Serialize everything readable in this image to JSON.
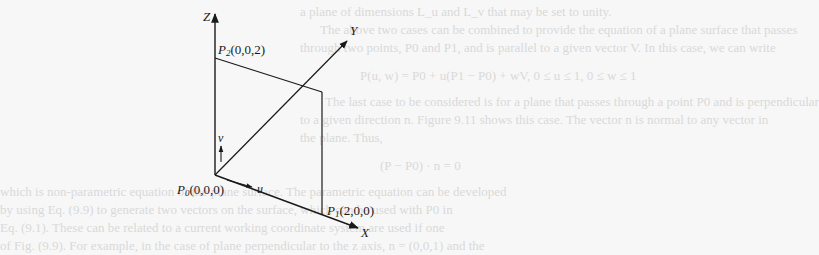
{
  "figure": {
    "axes": {
      "z_label": "Z",
      "y_label": "Y",
      "x_label": "X"
    },
    "points": [
      {
        "name": "P",
        "sub": "0",
        "coords": "(0,0,0)"
      },
      {
        "name": "P",
        "sub": "1",
        "coords": "(2,0,0)"
      },
      {
        "name": "P",
        "sub": "2",
        "coords": "(0,0,2)"
      }
    ],
    "vectors": {
      "u_label": "u",
      "v_label": "v"
    },
    "colors": {
      "line": "#1a1a1a",
      "background": "#f7f7f7",
      "bleed_text": "#d9d9d9"
    }
  },
  "bleed_through_text": [
    "a plane of dimensions L_u and L_v that may be set to unity.",
    "The above two cases can be combined to provide the equation of a plane surface that passes",
    "through two points, P0 and P1, and is parallel to a given vector V. In this case, we can write",
    "P(u, w) = P0 + u(P1 − P0) + wV,  0 ≤ u ≤ 1, 0 ≤ w ≤ 1",
    "The last case to be considered is for a plane that passes through a point P0 and is perpendicular",
    "to a given direction n. Figure 9.11 shows this case. The vector n is normal to any vector in",
    "the plane. Thus,",
    "(P − P0) · n = 0",
    "which is non-parametric equation of the plane surface. The parametric equation can be developed",
    "by using Eq. (9.9) to generate two vectors on the surface, which can be used with P0 in",
    "Eq. (9.1). These can be related to a current working coordinate system are used if one",
    "of Fig. (9.9). For example, in the case of plane perpendicular to the z axis, n = (0,0,1) and the"
  ]
}
